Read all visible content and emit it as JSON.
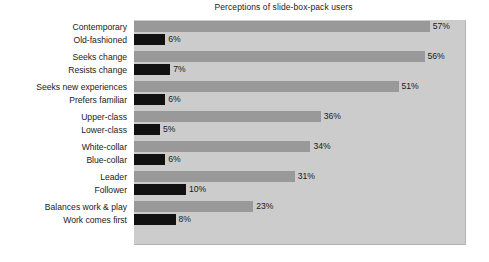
{
  "chart_data": {
    "type": "bar",
    "title": "Perceptions of slide-box-pack users",
    "xlabel": "",
    "ylabel": "",
    "orientation": "horizontal",
    "grid": false,
    "legend": null,
    "xlim": [
      0,
      64
    ],
    "value_suffix": "%",
    "categories": [
      "Contemporary",
      "Old-fashioned",
      "Seeks change",
      "Resists change",
      "Seeks new experiences",
      "Prefers familiar",
      "Upper-class",
      "Lower-class",
      "White-collar",
      "Blue-collar",
      "Leader",
      "Follower",
      "Balances work & play",
      "Work comes first"
    ],
    "values": [
      57,
      6,
      56,
      7,
      51,
      6,
      36,
      5,
      34,
      6,
      31,
      10,
      23,
      8
    ],
    "value_labels": [
      "57%",
      "6%",
      "56%",
      "7%",
      "51%",
      "6%",
      "36%",
      "5%",
      "34%",
      "6%",
      "31%",
      "10%",
      "23%",
      "8%"
    ],
    "pairs": [
      {
        "positive": {
          "label": "Contemporary",
          "value": 57,
          "text": "57%",
          "color": "#999999"
        },
        "negative": {
          "label": "Old-fashioned",
          "value": 6,
          "text": "6%",
          "color": "#111111"
        }
      },
      {
        "positive": {
          "label": "Seeks change",
          "value": 56,
          "text": "56%",
          "color": "#999999"
        },
        "negative": {
          "label": "Resists change",
          "value": 7,
          "text": "7%",
          "color": "#111111"
        }
      },
      {
        "positive": {
          "label": "Seeks new experiences",
          "value": 51,
          "text": "51%",
          "color": "#999999"
        },
        "negative": {
          "label": "Prefers familiar",
          "value": 6,
          "text": "6%",
          "color": "#111111"
        }
      },
      {
        "positive": {
          "label": "Upper-class",
          "value": 36,
          "text": "36%",
          "color": "#999999"
        },
        "negative": {
          "label": "Lower-class",
          "value": 5,
          "text": "5%",
          "color": "#111111"
        }
      },
      {
        "positive": {
          "label": "White-collar",
          "value": 34,
          "text": "34%",
          "color": "#999999"
        },
        "negative": {
          "label": "Blue-collar",
          "value": 6,
          "text": "6%",
          "color": "#111111"
        }
      },
      {
        "positive": {
          "label": "Leader",
          "value": 31,
          "text": "31%",
          "color": "#999999"
        },
        "negative": {
          "label": "Follower",
          "value": 10,
          "text": "10%",
          "color": "#111111"
        }
      },
      {
        "positive": {
          "label": "Balances work & play",
          "value": 23,
          "text": "23%",
          "color": "#999999"
        },
        "negative": {
          "label": "Work comes first",
          "value": 8,
          "text": "8%",
          "color": "#111111"
        }
      }
    ],
    "colors": {
      "positive_bar": "#999999",
      "negative_bar": "#111111",
      "plot_background": "#cccccc",
      "page_background": "#ffffff",
      "text": "#1a1a1a"
    }
  }
}
